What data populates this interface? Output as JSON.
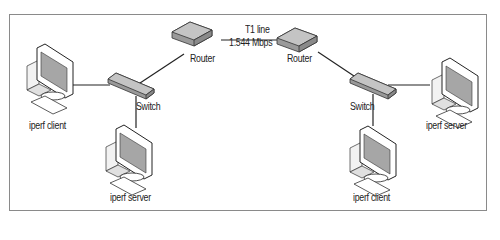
{
  "diagram": {
    "link": {
      "name": "T1 line",
      "speed": "1.544 Mbps"
    },
    "nodes": {
      "router_left": {
        "label": "Router"
      },
      "router_right": {
        "label": "Router"
      },
      "switch_left": {
        "label": "Switch"
      },
      "switch_right": {
        "label": "Switch"
      },
      "client_left": {
        "label": "iperf client"
      },
      "server_left": {
        "label": "iperf server"
      },
      "server_right": {
        "label": "iperf server"
      },
      "client_right": {
        "label": "iperf client"
      }
    },
    "colors": {
      "device_fill": "#b8b8b8",
      "device_dark": "#8c8c8c",
      "line": "#222222",
      "screen": "#a0a0a0"
    }
  }
}
